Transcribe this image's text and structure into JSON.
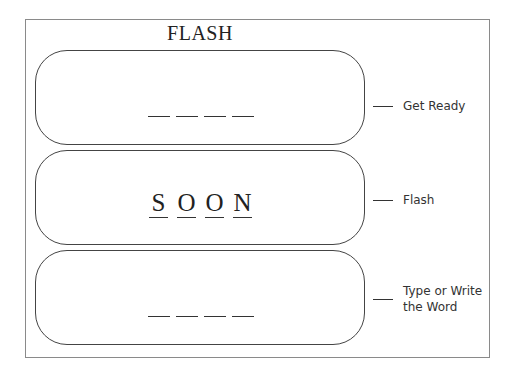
{
  "title": "FLASH",
  "stages": [
    {
      "label": "Get Ready",
      "content_type": "blanks",
      "blank_count": 4
    },
    {
      "label": "Flash",
      "content_type": "word",
      "letters": [
        "S",
        "O",
        "O",
        "N"
      ]
    },
    {
      "label": "Type or Write the Word",
      "label_lines": [
        "Type or Write",
        "the Word"
      ],
      "content_type": "blanks",
      "blank_count": 4
    }
  ],
  "colors": {
    "frame": "#8a8a8a",
    "box_border": "#444444",
    "text": "#222222"
  }
}
